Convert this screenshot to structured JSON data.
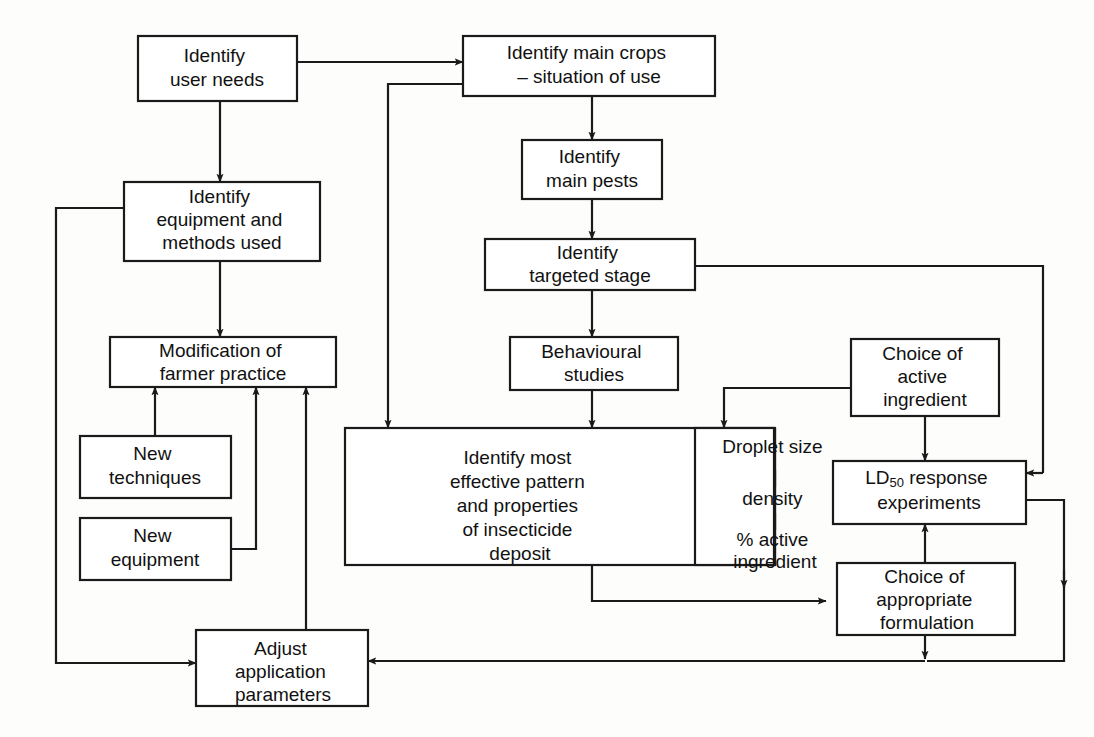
{
  "diagram": {
    "background_color": "#fdfdfc",
    "line_color": "#1a1a1a",
    "box_fill": "#ffffff"
  },
  "nodes": {
    "identify_user_needs": {
      "lines": [
        "Identify",
        "user needs"
      ]
    },
    "identify_main_crops": {
      "lines": [
        "Identify main crops",
        "– situation of use"
      ]
    },
    "identify_equipment": {
      "lines": [
        "Identify",
        "equipment and",
        "methods used"
      ]
    },
    "identify_main_pests": {
      "lines": [
        "Identify",
        "main pests"
      ]
    },
    "identify_targeted_stage": {
      "lines": [
        "Identify",
        "targeted stage"
      ]
    },
    "modification_farmer_practice": {
      "lines": [
        "Modification of",
        "farmer practice"
      ]
    },
    "behavioural_studies": {
      "lines": [
        "Behavioural",
        "studies"
      ]
    },
    "choice_active_ingredient": {
      "lines": [
        "Choice of",
        "active",
        "ingredient"
      ]
    },
    "new_techniques": {
      "lines": [
        "New",
        "techniques"
      ]
    },
    "identify_effective_pattern": {
      "lines": [
        "Identify most",
        "effective pattern",
        "and properties",
        "of insecticide",
        "deposit"
      ]
    },
    "droplet_properties": {
      "lines": [
        "Droplet size",
        "density",
        "% active",
        "ingredient"
      ]
    },
    "ld50_response": {
      "prefix": "LD",
      "subscript": "50",
      "suffix": " response",
      "line2": "experiments"
    },
    "new_equipment": {
      "lines": [
        "New",
        "equipment"
      ]
    },
    "choice_formulation": {
      "lines": [
        "Choice of",
        "appropriate",
        "formulation"
      ]
    },
    "adjust_parameters": {
      "lines": [
        "Adjust",
        "application",
        "parameters"
      ]
    }
  },
  "edges": [
    {
      "from": "identify_user_needs",
      "to": "identify_main_crops",
      "kind": "arrow"
    },
    {
      "from": "identify_user_needs",
      "to": "identify_equipment",
      "kind": "arrow"
    },
    {
      "from": "identify_main_crops",
      "to": "identify_main_pests",
      "kind": "arrow"
    },
    {
      "from": "identify_main_crops",
      "to": "identify_effective_pattern",
      "kind": "arrow"
    },
    {
      "from": "identify_equipment",
      "to": "modification_farmer_practice",
      "kind": "arrow"
    },
    {
      "from": "identify_equipment",
      "to": "adjust_parameters",
      "kind": "arrow"
    },
    {
      "from": "identify_main_pests",
      "to": "identify_targeted_stage",
      "kind": "arrow"
    },
    {
      "from": "identify_targeted_stage",
      "to": "behavioural_studies",
      "kind": "arrow"
    },
    {
      "from": "identify_targeted_stage",
      "to": "ld50_response",
      "kind": "arrow"
    },
    {
      "from": "behavioural_studies",
      "to": "identify_effective_pattern",
      "kind": "arrow"
    },
    {
      "from": "new_techniques",
      "to": "modification_farmer_practice",
      "kind": "arrow"
    },
    {
      "from": "new_equipment",
      "to": "modification_farmer_practice",
      "kind": "arrow"
    },
    {
      "from": "adjust_parameters",
      "to": "modification_farmer_practice",
      "kind": "arrow"
    },
    {
      "from": "choice_active_ingredient",
      "to": "droplet_properties",
      "kind": "arrow"
    },
    {
      "from": "choice_active_ingredient",
      "to": "ld50_response",
      "kind": "arrow"
    },
    {
      "from": "identify_effective_pattern",
      "to": "choice_formulation",
      "kind": "arrow"
    },
    {
      "from": "choice_formulation",
      "to": "ld50_response",
      "kind": "arrow"
    },
    {
      "from": "choice_formulation",
      "to": "adjust_parameters",
      "kind": "arrow"
    },
    {
      "from": "ld50_response",
      "to": "adjust_parameters",
      "kind": "arrow"
    }
  ]
}
